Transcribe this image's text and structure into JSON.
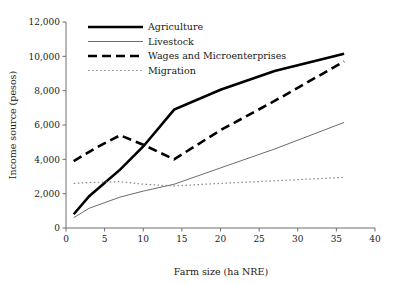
{
  "chart_data": {
    "type": "line",
    "title": "",
    "xlabel": "Farm size (ha NRE)",
    "ylabel": "Income source (pesos)",
    "xlim": [
      0,
      40
    ],
    "ylim": [
      0,
      12000
    ],
    "xticks": [
      "0",
      "5",
      "10",
      "15",
      "20",
      "25",
      "30",
      "35",
      "40"
    ],
    "xtick_values": [
      0,
      5,
      10,
      15,
      20,
      25,
      30,
      35,
      40
    ],
    "yticks": [
      "0",
      "2,000",
      "4,000",
      "6,000",
      "8,000",
      "10,000",
      "12,000"
    ],
    "ytick_values": [
      0,
      2000,
      4000,
      6000,
      8000,
      10000,
      12000
    ],
    "grid": false,
    "legend_position": "top-center",
    "series": [
      {
        "name": "Agriculture",
        "style": "solid-thick",
        "color": "#000000",
        "width": 2.6,
        "dash": "",
        "x": [
          1,
          3,
          7,
          10,
          14,
          20,
          27,
          36
        ],
        "values": [
          800,
          1850,
          3400,
          4750,
          6900,
          8050,
          9150,
          10150
        ]
      },
      {
        "name": "Livestock",
        "style": "solid-thin",
        "color": "#5a5a5a",
        "width": 0.9,
        "dash": "",
        "x": [
          1,
          3,
          7,
          10,
          14,
          20,
          27,
          36
        ],
        "values": [
          600,
          1150,
          1800,
          2150,
          2550,
          3500,
          4600,
          6150
        ]
      },
      {
        "name": "Wages and Microenterprises",
        "style": "dashed-thick",
        "color": "#000000",
        "width": 2.6,
        "dash": "9,5",
        "x": [
          1,
          4,
          7,
          10,
          14,
          20,
          27,
          36
        ],
        "values": [
          3900,
          4700,
          5400,
          4850,
          4000,
          5700,
          7400,
          9700
        ]
      },
      {
        "name": "Migration",
        "style": "dotted-thin",
        "color": "#8a8a8a",
        "width": 1.2,
        "dash": "1.6,2.4",
        "x": [
          1,
          3,
          7,
          10,
          14,
          20,
          27,
          36
        ],
        "values": [
          2600,
          2650,
          2700,
          2550,
          2450,
          2600,
          2750,
          2950
        ]
      }
    ]
  },
  "legend": {
    "items": [
      {
        "label": "Agriculture"
      },
      {
        "label": "Livestock"
      },
      {
        "label": "Wages and Microenterprises"
      },
      {
        "label": "Migration"
      }
    ]
  }
}
